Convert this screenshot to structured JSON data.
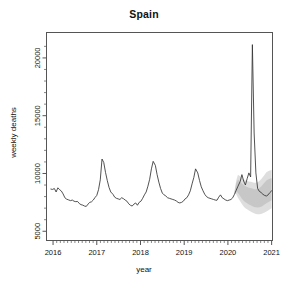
{
  "chart_data": {
    "type": "line",
    "title": "Spain",
    "xlabel": "year",
    "ylabel": "weekly deaths",
    "grid": false,
    "legend": null,
    "xlim": [
      2015.85,
      2021.02
    ],
    "ylim": [
      4200,
      22200
    ],
    "xticks": [
      2016,
      2017,
      2018,
      2019,
      2020,
      2021
    ],
    "xtick_labels": [
      "2016",
      "2017",
      "2018",
      "2019",
      "2020",
      "2021"
    ],
    "yticks": [
      5000,
      10000,
      15000,
      20000
    ],
    "ytick_labels": [
      "5000",
      "10000",
      "15000",
      "20000"
    ],
    "series": [
      {
        "name": "weekly deaths",
        "color": "#333333",
        "x": [
          2015.95,
          2015.99,
          2016.03,
          2016.07,
          2016.11,
          2016.15,
          2016.19,
          2016.23,
          2016.27,
          2016.31,
          2016.35,
          2016.4,
          2016.44,
          2016.48,
          2016.52,
          2016.56,
          2016.6,
          2016.64,
          2016.68,
          2016.72,
          2016.76,
          2016.8,
          2016.84,
          2016.88,
          2016.92,
          2016.96,
          2017.0,
          2017.04,
          2017.08,
          2017.12,
          2017.16,
          2017.2,
          2017.24,
          2017.28,
          2017.32,
          2017.37,
          2017.41,
          2017.45,
          2017.49,
          2017.53,
          2017.57,
          2017.61,
          2017.65,
          2017.69,
          2017.73,
          2017.77,
          2017.81,
          2017.85,
          2017.89,
          2017.93,
          2017.97,
          2018.01,
          2018.05,
          2018.09,
          2018.13,
          2018.17,
          2018.21,
          2018.25,
          2018.29,
          2018.34,
          2018.38,
          2018.42,
          2018.46,
          2018.5,
          2018.54,
          2018.58,
          2018.62,
          2018.66,
          2018.7,
          2018.74,
          2018.78,
          2018.82,
          2018.86,
          2018.9,
          2018.94,
          2018.98,
          2019.02,
          2019.06,
          2019.1,
          2019.14,
          2019.18,
          2019.22,
          2019.26,
          2019.31,
          2019.35,
          2019.39,
          2019.43,
          2019.47,
          2019.51,
          2019.55,
          2019.59,
          2019.63,
          2019.67,
          2019.71,
          2019.75,
          2019.79,
          2019.83,
          2019.87,
          2019.91,
          2019.95,
          2019.99,
          2020.03,
          2020.07,
          2020.11,
          2020.15,
          2020.19,
          2020.23,
          2020.28,
          2020.32,
          2020.36,
          2020.4,
          2020.44,
          2020.48,
          2020.52,
          2020.56,
          2020.6,
          2020.64,
          2020.68,
          2020.72,
          2020.76,
          2020.8,
          2020.84,
          2020.88,
          2020.92,
          2020.96,
          2021.0
        ],
        "values": [
          8650,
          8620,
          8700,
          8400,
          8760,
          8600,
          8480,
          8230,
          7900,
          7780,
          7720,
          7650,
          7700,
          7600,
          7560,
          7580,
          7400,
          7300,
          7260,
          7180,
          7150,
          7350,
          7500,
          7550,
          7700,
          7920,
          8100,
          8600,
          9450,
          11250,
          10950,
          10100,
          9400,
          8800,
          8400,
          8200,
          7950,
          7850,
          7800,
          7750,
          7900,
          7820,
          7700,
          7600,
          7380,
          7250,
          7180,
          7350,
          7450,
          7250,
          7500,
          7600,
          7850,
          8150,
          8400,
          8900,
          9500,
          10400,
          11050,
          10700,
          9900,
          9250,
          8700,
          8300,
          8150,
          8050,
          7900,
          7850,
          7800,
          7750,
          7700,
          7620,
          7500,
          7450,
          7500,
          7600,
          7800,
          7900,
          8150,
          8500,
          9100,
          9650,
          10400,
          10050,
          9400,
          8850,
          8500,
          8200,
          8000,
          7900,
          7850,
          7800,
          7750,
          7700,
          7680,
          7950,
          8150,
          7900,
          7800,
          7700,
          7650,
          7700,
          7750,
          7900,
          8200,
          8550,
          8900,
          9300,
          9900,
          9350,
          9000,
          9550,
          10050,
          9700,
          21150,
          13500,
          10050,
          8700,
          8450,
          8350,
          8200,
          8100,
          8050,
          8150,
          8350,
          8500
        ]
      }
    ],
    "prediction_band": {
      "name": "prediction interval",
      "color": "#c9c9c9",
      "start_x": 2020.15,
      "end_x": 2021.0,
      "description": "grey shaded expected-mortality band widening after early 2020",
      "x": [
        2020.15,
        2020.19,
        2020.23,
        2020.28,
        2020.32,
        2020.36,
        2020.4,
        2020.44,
        2020.48,
        2020.52,
        2020.56,
        2020.6,
        2020.64,
        2020.68,
        2020.72,
        2020.76,
        2020.8,
        2020.84,
        2020.88,
        2020.92,
        2020.96,
        2021.0
      ],
      "upper": [
        8450,
        9400,
        9900,
        9750,
        9600,
        9500,
        9400,
        9350,
        9300,
        9280,
        9250,
        9200,
        9200,
        9250,
        9350,
        9500,
        9700,
        9900,
        10100,
        10200,
        10250,
        10300
      ],
      "lower": [
        8250,
        8200,
        7900,
        7600,
        7350,
        7150,
        7000,
        6900,
        6800,
        6700,
        6620,
        6550,
        6500,
        6480,
        6480,
        6500,
        6550,
        6620,
        6700,
        6800,
        6900,
        7000
      ]
    }
  },
  "figure": {
    "background_color": "#ffffff",
    "axis_color": "#555555",
    "line_color": "#333333",
    "band_color": "#c9c9c9"
  }
}
